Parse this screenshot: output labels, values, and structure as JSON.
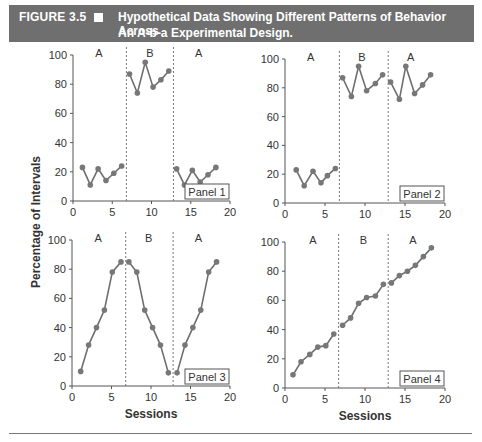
{
  "figure": {
    "label": "FIGURE 3.5",
    "title_line1": "Hypothetical Data Showing Different Patterns of Behavior Across",
    "title_line2": "An A-b-a Experimental Design.",
    "header_bg": "#6f6f6f"
  },
  "chart_data": [
    {
      "type": "line",
      "title": "Panel 1",
      "xlabel": "",
      "ylabel": "Percentage of Intervals",
      "xlim": [
        0,
        20
      ],
      "ylim": [
        0,
        100
      ],
      "xticks": [
        0,
        5,
        10,
        15,
        20
      ],
      "yticks": [
        0,
        20,
        40,
        60,
        80,
        100
      ],
      "phase_lines": [
        6.8,
        12.8
      ],
      "phase_labels": [
        {
          "label": "A",
          "x": 3.3
        },
        {
          "label": "B",
          "x": 9.8
        },
        {
          "label": "A",
          "x": 16.0
        }
      ],
      "series": [
        {
          "name": "A1",
          "x": [
            1.2,
            2.2,
            3.2,
            4.2,
            5.2,
            6.2
          ],
          "values": [
            23,
            11,
            22,
            14,
            19,
            24
          ]
        },
        {
          "name": "B",
          "x": [
            7.2,
            8.2,
            9.2,
            10.2,
            11.2,
            12.2
          ],
          "values": [
            87,
            74,
            95,
            78,
            83,
            89
          ]
        },
        {
          "name": "A2",
          "x": [
            13.2,
            14.2,
            15.2,
            16.2,
            17.2,
            18.2
          ],
          "values": [
            22,
            11,
            21,
            13,
            18,
            23
          ]
        }
      ]
    },
    {
      "type": "line",
      "title": "Panel 2",
      "xlim": [
        0,
        20
      ],
      "ylim": [
        0,
        100
      ],
      "xticks": [
        0,
        5,
        10,
        15,
        20
      ],
      "yticks": [
        0,
        20,
        40,
        60,
        80,
        100
      ],
      "phase_lines": [
        6.8,
        12.9
      ],
      "phase_labels": [
        {
          "label": "A",
          "x": 3.2
        },
        {
          "label": "B",
          "x": 9.6
        },
        {
          "label": "A",
          "x": 15.7
        }
      ],
      "series": [
        {
          "name": "A1",
          "x": [
            1.4,
            2.4,
            3.5,
            4.5,
            5.3,
            6.3
          ],
          "values": [
            23,
            12,
            22,
            14,
            19,
            24
          ]
        },
        {
          "name": "B",
          "x": [
            7.2,
            8.3,
            9.2,
            10.2,
            11.3,
            12.2
          ],
          "values": [
            87,
            74,
            95,
            78,
            83,
            89
          ]
        },
        {
          "name": "A2",
          "x": [
            13.2,
            14.3,
            15.1,
            16.2,
            17.2,
            18.2
          ],
          "values": [
            84,
            72,
            95,
            76,
            82,
            89
          ]
        }
      ]
    },
    {
      "type": "line",
      "title": "Panel 3",
      "xlabel": "Sessions",
      "xlim": [
        0,
        20
      ],
      "ylim": [
        0,
        100
      ],
      "xticks": [
        0,
        5,
        10,
        15,
        20
      ],
      "yticks": [
        0,
        20,
        40,
        60,
        80,
        100
      ],
      "phase_lines": [
        6.8,
        12.8
      ],
      "phase_labels": [
        {
          "label": "A",
          "x": 3.3
        },
        {
          "label": "B",
          "x": 9.7
        },
        {
          "label": "A",
          "x": 16.0
        }
      ],
      "series": [
        {
          "name": "A1",
          "x": [
            1.1,
            2.1,
            3.1,
            4.1,
            5.1,
            6.2
          ],
          "values": [
            10,
            28,
            40,
            52,
            78,
            85
          ]
        },
        {
          "name": "B",
          "x": [
            7.2,
            8.2,
            9.2,
            10.2,
            11.2,
            12.2
          ],
          "values": [
            85,
            78,
            52,
            40,
            28,
            9
          ]
        },
        {
          "name": "A2",
          "x": [
            13.3,
            14.3,
            15.3,
            16.3,
            17.3,
            18.3
          ],
          "values": [
            9,
            28,
            40,
            52,
            78,
            85
          ]
        }
      ]
    },
    {
      "type": "line",
      "title": "Panel 4",
      "xlabel": "Sessions",
      "xlim": [
        0,
        20
      ],
      "ylim": [
        0,
        100
      ],
      "xticks": [
        0,
        5,
        10,
        15,
        20
      ],
      "yticks": [
        0,
        20,
        40,
        60,
        80,
        100
      ],
      "phase_lines": [
        6.7,
        12.9
      ],
      "phase_labels": [
        {
          "label": "A",
          "x": 3.5
        },
        {
          "label": "B",
          "x": 9.8
        },
        {
          "label": "A",
          "x": 16.0
        }
      ],
      "series": [
        {
          "name": "A1",
          "x": [
            1.0,
            2.0,
            3.1,
            4.1,
            5.1,
            6.1
          ],
          "values": [
            9,
            18,
            23,
            28,
            29,
            37
          ]
        },
        {
          "name": "B",
          "x": [
            7.2,
            8.2,
            9.2,
            10.2,
            11.3,
            12.3
          ],
          "values": [
            43,
            48,
            58,
            62,
            63,
            71
          ]
        },
        {
          "name": "A2",
          "x": [
            13.3,
            14.3,
            15.3,
            16.3,
            17.3,
            18.3
          ],
          "values": [
            72,
            77,
            80,
            84,
            90,
            96
          ]
        }
      ]
    }
  ],
  "shared": {
    "ylabel": "Percentage of Intervals",
    "xlabel": "Sessions",
    "line_color": "#6e6e6e",
    "marker_color": "#777777",
    "text_color": "#333333"
  }
}
